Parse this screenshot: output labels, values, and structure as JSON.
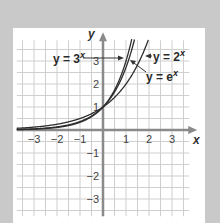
{
  "chart_data": {
    "type": "line",
    "title": "",
    "xlabel": "x",
    "ylabel": "y",
    "xlim": [
      -3.75,
      3.75
    ],
    "ylim": [
      -3.75,
      3.9
    ],
    "grid": true,
    "grid_step": 0.5,
    "x_ticks": [
      -3,
      -2,
      -1,
      1,
      2,
      3
    ],
    "x_tick_labels": [
      "−3",
      "−2",
      "−1",
      "1",
      "2",
      "3"
    ],
    "y_ticks": [
      3,
      2,
      1,
      -1,
      -2,
      -3
    ],
    "y_tick_labels": [
      "3",
      "2",
      "1",
      "−1",
      "−2",
      "−3"
    ],
    "series": [
      {
        "name": "y = 3^x",
        "base": 3,
        "label": "y = 3",
        "exponent": "x"
      },
      {
        "name": "y = e^x",
        "base": 2.718281828,
        "label": "y = e",
        "exponent": "x"
      },
      {
        "name": "y = 2^x",
        "base": 2,
        "label": "y = 2",
        "exponent": "x"
      }
    ],
    "annotations": [
      {
        "text": "y = 3^x",
        "arrow_to": "curve 3^x at y≈3.1"
      },
      {
        "text": "y = 2^x",
        "arrow_to": "curve 2^x at y≈3.1"
      },
      {
        "text": "y = e^x",
        "arrow_to": "curve e^x at y≈3"
      }
    ]
  },
  "labels": {
    "axis_x": "x",
    "axis_y": "y",
    "exp_text": "x",
    "label_3x": "y = 3",
    "label_2x": "y = 2",
    "label_ex": "y = e"
  },
  "colors": {
    "background": "#c9c9c9",
    "panel": "#ffffff",
    "grid": "#cfcfcf",
    "axis": "#8a8a8a",
    "curve": "#2e2e2e"
  }
}
